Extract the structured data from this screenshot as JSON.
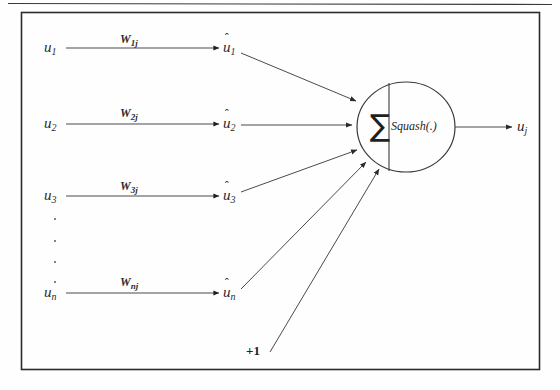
{
  "figure": {
    "background_color": "#fefefe",
    "stroke_color": "#2b2b2b",
    "border": {
      "x": 21,
      "y": 12,
      "width": 519,
      "height": 358
    },
    "top_rule": {
      "y": 3
    }
  },
  "inputs": [
    {
      "name": "u1",
      "base": "u",
      "subscript": "1",
      "x": 46,
      "y": 48,
      "weight_label": "W",
      "weight_sub": "1j"
    },
    {
      "name": "u2",
      "base": "u",
      "subscript": "2",
      "x": 46,
      "y": 124,
      "weight_label": "W",
      "weight_sub": "2j"
    },
    {
      "name": "u3",
      "base": "u",
      "subscript": "3",
      "x": 46,
      "y": 196,
      "weight_label": "W",
      "weight_sub": "3j"
    },
    {
      "name": "un",
      "base": "u",
      "subscript": "n",
      "x": 46,
      "y": 293,
      "weight_label": "W",
      "weight_sub": "nj"
    }
  ],
  "weighted_inputs": [
    {
      "name": "uhat1",
      "base": "u",
      "subscript": "1",
      "x": 224,
      "y": 48
    },
    {
      "name": "uhat2",
      "base": "u",
      "subscript": "2",
      "x": 224,
      "y": 124
    },
    {
      "name": "uhat3",
      "base": "u",
      "subscript": "3",
      "x": 224,
      "y": 196
    },
    {
      "name": "uhatn",
      "base": "u",
      "subscript": "n",
      "x": 224,
      "y": 293
    }
  ],
  "ellipsis_dots": [
    {
      "x": 54,
      "y": 218
    },
    {
      "x": 54,
      "y": 240
    },
    {
      "x": 54,
      "y": 261
    },
    {
      "x": 54,
      "y": 281
    }
  ],
  "bias": {
    "label": "+1",
    "x": 246,
    "y": 344
  },
  "neuron": {
    "center_x": 406,
    "center_y": 127,
    "radius_x": 49,
    "radius_y": 45,
    "divider_x": 389,
    "sum_symbol": "∑",
    "activation_label": "Squash(.)"
  },
  "output": {
    "base": "u",
    "subscript": "j",
    "x": 518,
    "y": 127,
    "arrow_from_x": 455,
    "arrow_to_x": 512
  }
}
